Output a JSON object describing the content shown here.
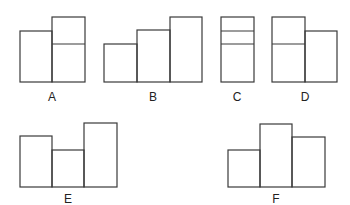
{
  "figures": [
    {
      "label": "A",
      "label_pos": [
        52,
        101
      ],
      "boxes": [
        [
          20,
          31,
          32,
          51
        ],
        [
          52,
          17,
          33,
          65
        ]
      ],
      "dividers": [
        [
          52,
          44,
          85,
          44
        ]
      ]
    },
    {
      "label": "B",
      "label_pos": [
        153,
        101
      ],
      "boxes": [
        [
          104,
          44,
          33,
          38
        ],
        [
          137,
          30,
          33,
          52
        ],
        [
          170,
          17,
          32,
          65
        ]
      ],
      "dividers": []
    },
    {
      "label": "C",
      "label_pos": [
        237,
        101
      ],
      "boxes": [
        [
          221,
          17,
          33,
          65
        ]
      ],
      "dividers": [
        [
          221,
          31,
          254,
          31
        ],
        [
          221,
          44,
          254,
          44
        ]
      ]
    },
    {
      "label": "D",
      "label_pos": [
        305,
        101
      ],
      "boxes": [
        [
          272,
          17,
          33,
          65
        ],
        [
          305,
          31,
          32,
          51
        ]
      ],
      "dividers": [
        [
          272,
          44,
          305,
          44
        ]
      ]
    },
    {
      "label": "E",
      "label_pos": [
        68,
        203
      ],
      "boxes": [
        [
          20,
          136,
          32,
          51
        ],
        [
          52,
          150,
          32,
          37
        ],
        [
          84,
          123,
          33,
          64
        ]
      ],
      "dividers": []
    },
    {
      "label": "F",
      "label_pos": [
        276,
        203
      ],
      "boxes": [
        [
          228,
          150,
          32,
          37
        ],
        [
          260,
          124,
          32,
          63
        ],
        [
          292,
          137,
          33,
          50
        ]
      ],
      "dividers": []
    }
  ]
}
